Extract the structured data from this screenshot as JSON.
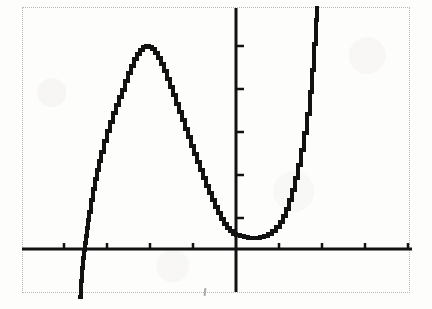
{
  "screen": {
    "title": "Graphing calculator display",
    "description": "Scanned black-and-white graphing calculator screen showing a quartic-like polynomial curve on x and y axes",
    "background_color": "#ffffff",
    "ink_color": "#121212",
    "border_color": "#b9b9b9",
    "border_style": "dotted"
  },
  "chart_data": {
    "type": "line",
    "title": "",
    "subtitle": "",
    "xlabel": "",
    "ylabel": "",
    "legend": [],
    "grid": false,
    "axes": {
      "x_axis_label": "x",
      "y_axis_label": "y",
      "x_axis_pixel_y": 249,
      "y_axis_pixel_x": 236,
      "xlim": [
        -5,
        4.5
      ],
      "ylim": [
        -1.4,
        5.6
      ],
      "x_tick_count": 9,
      "y_tick_count": 5,
      "x_tick_pixels": [
        64,
        107,
        150,
        193,
        279,
        322,
        365,
        408
      ],
      "y_tick_pixels": [
        46,
        89,
        132,
        175,
        218
      ],
      "tick_spacing_px": 43,
      "tick_length_px": 7,
      "axis_line_width_px": 3
    },
    "features": {
      "local_maximum": {
        "x_px": 143,
        "y_px": 47,
        "label": "local maximum"
      },
      "local_minimum": {
        "x_px": 260,
        "y_px": 237,
        "label": "local minimum"
      },
      "left_x_intercept_px": 86,
      "descending_branch_exit_x_px": 80,
      "rising_branch_exit_x_px": 316
    },
    "series": [
      {
        "name": "curve",
        "stroke": "#121212",
        "stroke_width_px": 4,
        "rendering": "stair-stepped pixelated calculator plot",
        "points_px": [
          [
            80,
            297
          ],
          [
            81,
            281
          ],
          [
            82,
            268
          ],
          [
            83,
            258
          ],
          [
            84,
            250
          ],
          [
            85,
            243
          ],
          [
            86,
            236
          ],
          [
            87,
            228
          ],
          [
            88,
            220
          ],
          [
            89,
            212
          ],
          [
            91,
            200
          ],
          [
            93,
            189
          ],
          [
            95,
            179
          ],
          [
            97,
            170
          ],
          [
            99,
            161
          ],
          [
            101,
            152
          ],
          [
            104,
            141
          ],
          [
            107,
            131
          ],
          [
            110,
            122
          ],
          [
            113,
            113
          ],
          [
            116,
            105
          ],
          [
            119,
            97
          ],
          [
            122,
            90
          ],
          [
            125,
            81
          ],
          [
            128,
            73
          ],
          [
            131,
            66
          ],
          [
            134,
            59
          ],
          [
            137,
            54
          ],
          [
            140,
            50
          ],
          [
            143,
            47
          ],
          [
            146,
            46
          ],
          [
            149,
            47
          ],
          [
            152,
            49
          ],
          [
            155,
            53
          ],
          [
            158,
            58
          ],
          [
            161,
            64
          ],
          [
            164,
            71
          ],
          [
            167,
            79
          ],
          [
            170,
            87
          ],
          [
            173,
            95
          ],
          [
            176,
            104
          ],
          [
            179,
            112
          ],
          [
            182,
            120
          ],
          [
            185,
            129
          ],
          [
            188,
            137
          ],
          [
            191,
            146
          ],
          [
            194,
            154
          ],
          [
            197,
            162
          ],
          [
            200,
            170
          ],
          [
            203,
            178
          ],
          [
            206,
            186
          ],
          [
            209,
            193
          ],
          [
            212,
            200
          ],
          [
            215,
            207
          ],
          [
            218,
            213
          ],
          [
            221,
            219
          ],
          [
            224,
            224
          ],
          [
            227,
            228
          ],
          [
            230,
            231
          ],
          [
            233,
            234
          ],
          [
            236,
            235
          ],
          [
            240,
            236
          ],
          [
            244,
            237
          ],
          [
            248,
            238
          ],
          [
            252,
            238
          ],
          [
            256,
            238
          ],
          [
            260,
            237
          ],
          [
            264,
            236
          ],
          [
            268,
            234
          ],
          [
            272,
            231
          ],
          [
            276,
            227
          ],
          [
            280,
            222
          ],
          [
            283,
            216
          ],
          [
            286,
            209
          ],
          [
            289,
            200
          ],
          [
            292,
            190
          ],
          [
            295,
            178
          ],
          [
            298,
            165
          ],
          [
            301,
            150
          ],
          [
            304,
            133
          ],
          [
            307,
            114
          ],
          [
            310,
            92
          ],
          [
            312,
            70
          ],
          [
            314,
            44
          ],
          [
            316,
            20
          ],
          [
            317,
            8
          ]
        ]
      }
    ]
  }
}
